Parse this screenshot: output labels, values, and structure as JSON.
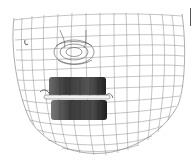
{
  "figure": {
    "regions": [
      "nose",
      "upper-lip",
      "lower-lip",
      "chin",
      "cheek"
    ],
    "colors": {
      "background": "#ffffff",
      "mesh_line": "#6a6a6a",
      "lip_dark": "#2a2a2a",
      "lip_mid": "#555555",
      "lip_gap": "#f2f2f2"
    }
  }
}
